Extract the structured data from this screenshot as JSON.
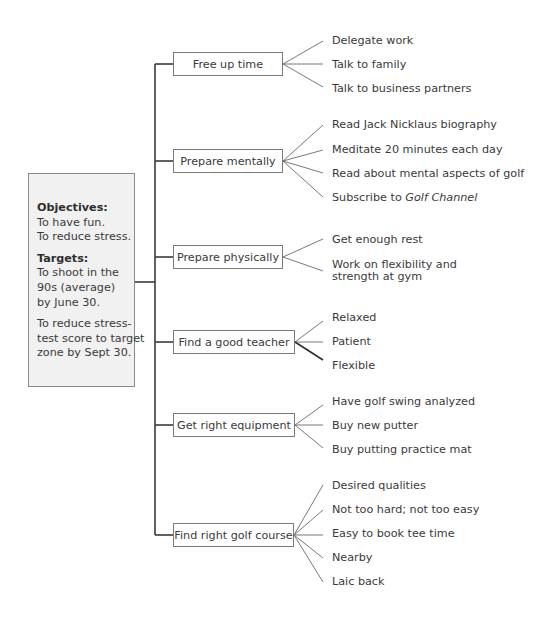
{
  "diagram": {
    "type": "tree",
    "root": {
      "objectives_heading": "Objectives:",
      "objectives": [
        "To have fun.",
        "To reduce stress."
      ],
      "targets_heading": "Targets:",
      "target_1_lines": [
        "To shoot in the",
        "90s (average)",
        "by June 30."
      ],
      "target_2_lines": [
        "To reduce stress-",
        "test score to target",
        "zone by Sept 30."
      ]
    },
    "branches": [
      {
        "label": "Free up time",
        "leaves": [
          "Delegate work",
          "Talk to family",
          "Talk to business partners"
        ]
      },
      {
        "label": "Prepare mentally",
        "leaves": [
          "Read Jack Nicklaus biography",
          "Meditate 20 minutes each day",
          "Read about mental aspects of golf"
        ],
        "leaf_4_prefix": "Subscribe to ",
        "leaf_4_italic": "Golf Channel"
      },
      {
        "label": "Prepare physically",
        "leaves": [
          "Get enough rest",
          "Work on flexibility and",
          "strength at gym"
        ]
      },
      {
        "label": "Find a good teacher",
        "leaves": [
          "Relaxed",
          "Patient",
          "Flexible"
        ]
      },
      {
        "label": "Get right equipment",
        "leaves": [
          "Have golf swing analyzed",
          "Buy new putter",
          "Buy putting practice mat"
        ]
      },
      {
        "label": "Find right golf course",
        "leaves": [
          "Desired qualities",
          "Not too hard; not too easy",
          "Easy to book tee time",
          "Nearby",
          "Laic back"
        ]
      }
    ]
  }
}
